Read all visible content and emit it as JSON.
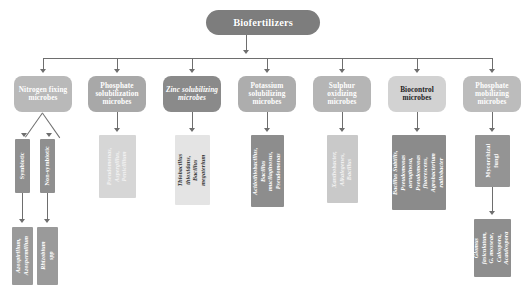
{
  "diagram": {
    "title": "Biofertilizers",
    "root": {
      "label": "Biofertilizers",
      "color": "#7d7d7d"
    },
    "branches": [
      {
        "id": "nitrogen-fixing",
        "label": "Nitrogen fixing microbes",
        "color": "#b9b9b9",
        "children": [
          {
            "id": "symbiotic",
            "label": "Symbiotic",
            "color": "#8f8f8f",
            "children": [
              {
                "id": "symbiotic-genera",
                "label": "Azospirillum, Azospermillum",
                "color": "#9a9a9a"
              }
            ]
          },
          {
            "id": "non-symbiotic",
            "label": "Non-symbiotic",
            "color": "#8f8f8f",
            "children": [
              {
                "id": "non-symbiotic-genera",
                "label": "Rhizobium spp",
                "color": "#9a9a9a"
              }
            ]
          }
        ]
      },
      {
        "id": "phosphate-solubilization",
        "label": "Phosphate solubilization microbes",
        "color": "#a8a8a8",
        "children": [
          {
            "id": "phosphate-solubilization-genera",
            "label": "Pseudomonas, Aspergillus, Penicillium",
            "color": "#d6d6d6"
          }
        ]
      },
      {
        "id": "zinc-solubilizing",
        "label": "Zinc solubilizing microbes",
        "color": "#8a8a8a",
        "children": [
          {
            "id": "zinc-solubilizing-genera",
            "label": "Thiobacillus thioxidans, Bacillus megaterium",
            "color": "#e4e4e4"
          }
        ]
      },
      {
        "id": "potassium-solubilizing",
        "label": "Potassium solubilizing microbes",
        "color": "#adadad",
        "children": [
          {
            "id": "potassium-solubilizing-genera",
            "label": "Acidothiobacillus, Bacillus mucilaginosus, Pseudomonas",
            "color": "#8d8d8d"
          }
        ]
      },
      {
        "id": "sulphur-oxidizing",
        "label": "Sulphur oxidizing microbes",
        "color": "#b5b5b5",
        "children": [
          {
            "id": "sulphur-oxidizing-genera",
            "label": "Xanthobacter, Alkalegenes, Bacillus",
            "color": "#c9c9c9"
          }
        ]
      },
      {
        "id": "biocontrol",
        "label": "Biocontrol microbes",
        "color": "#d2d2d2",
        "children": [
          {
            "id": "biocontrol-genera",
            "label": "Bacillus Subtilis, Pseudomonas aeruginosa, Pseudomonas fluorescens, Agrobacterium radiobacter",
            "color": "#8b8b8b"
          }
        ]
      },
      {
        "id": "phosphate-mobilizing",
        "label": "Phosphate mobilizing microbes",
        "color": "#bcbcbc",
        "children": [
          {
            "id": "mycorrhizal-fungi",
            "label": "Mycorrhizal fungi",
            "color": "#949494",
            "children": [
              {
                "id": "mycorrhizal-genera",
                "label": "Glomus fasiculatum, G. mosseae, Calospora, Acaulospora",
                "color": "#8e8e8e"
              }
            ]
          }
        ]
      }
    ]
  }
}
